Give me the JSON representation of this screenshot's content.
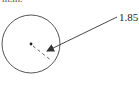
{
  "figure": {
    "clipped_top_text": "m.m.",
    "dimension_label": "1.85 mm",
    "circle": {
      "cx": 31,
      "cy": 44,
      "r": 29,
      "stroke": "#555555"
    },
    "center_dot": {
      "cx": 31,
      "cy": 44
    },
    "radius_line": {
      "style": "dashed",
      "x1": 31,
      "y1": 44,
      "x2": 52,
      "y2": 61
    },
    "arrow": {
      "x1": 117,
      "y1": 17,
      "x2": 47,
      "y2": 51
    }
  }
}
